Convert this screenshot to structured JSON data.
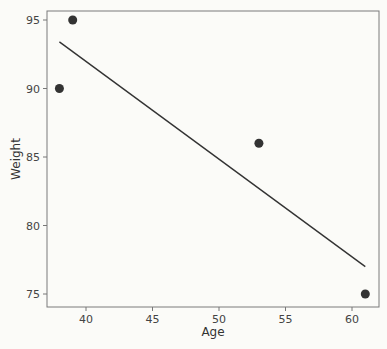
{
  "chart_data": {
    "type": "scatter",
    "title": "",
    "xlabel": "Age",
    "ylabel": "Weight",
    "xlim": [
      37.3,
      62
    ],
    "ylim": [
      74.3,
      95.7
    ],
    "xticks": [
      40,
      45,
      50,
      55,
      60
    ],
    "yticks": [
      75,
      80,
      85,
      90,
      95
    ],
    "grid": false,
    "legend": null,
    "points": [
      {
        "x": 38,
        "y": 90
      },
      {
        "x": 39,
        "y": 95
      },
      {
        "x": 53,
        "y": 86
      },
      {
        "x": 61,
        "y": 75
      }
    ],
    "fit_line": {
      "x": [
        38,
        61
      ],
      "y": [
        93.4,
        77.0
      ]
    },
    "colors": {
      "point": "#333333",
      "line": "#333333",
      "frame": "#777777"
    }
  }
}
